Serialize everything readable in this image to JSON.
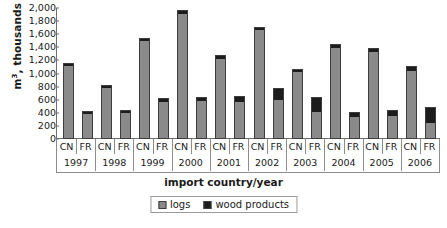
{
  "chart_data": {
    "type": "bar",
    "subtype": "stacked-grouped",
    "title": "",
    "xlabel": "import country/year",
    "ylabel": "m³, thousands",
    "ylim": [
      0,
      2000
    ],
    "ytick_step": 200,
    "grid": false,
    "legend_position": "bottom-center",
    "categories": [
      "1997",
      "1998",
      "1999",
      "2000",
      "2001",
      "2002",
      "2003",
      "2004",
      "2005",
      "2006"
    ],
    "group_members": [
      "CN",
      "FR"
    ],
    "ytick_labels": [
      "2,000",
      "1,800",
      "1,600",
      "1,400",
      "1,200",
      "1,000",
      "800",
      "600",
      "400",
      "200",
      "0"
    ],
    "ytick_values": [
      2000,
      1800,
      1600,
      1400,
      1200,
      1000,
      800,
      600,
      400,
      200,
      0
    ],
    "series": [
      {
        "name": "logs",
        "color": "#8a8a8a",
        "values_cn": [
          1130,
          800,
          1510,
          1930,
          1240,
          1680,
          1030,
          1400,
          1350,
          1050
        ],
        "values_fr": [
          400,
          410,
          570,
          590,
          570,
          610,
          420,
          340,
          360,
          240
        ]
      },
      {
        "name": "wood products",
        "color": "#1c1c1c",
        "values_cn": [
          30,
          25,
          30,
          35,
          40,
          35,
          40,
          50,
          45,
          60
        ],
        "values_fr": [
          35,
          35,
          55,
          45,
          85,
          175,
          225,
          65,
          85,
          250
        ]
      }
    ],
    "totals_cn": [
      1160,
      825,
      1540,
      1965,
      1280,
      1715,
      1070,
      1450,
      1395,
      1110
    ],
    "totals_fr": [
      435,
      445,
      625,
      635,
      655,
      785,
      645,
      405,
      445,
      490
    ],
    "legend": [
      {
        "label": "logs",
        "color": "#8a8a8a"
      },
      {
        "label": "wood products",
        "color": "#1c1c1c"
      }
    ]
  },
  "axes": {
    "y_title_main": "m",
    "y_title_sup": "3",
    "y_title_rest": ", thousands",
    "x_title": "import country/year"
  }
}
